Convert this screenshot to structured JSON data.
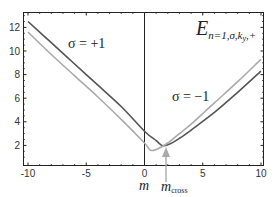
{
  "chart_data": {
    "type": "line",
    "xlabel": "m",
    "ylabel": "",
    "xlim": [
      -10,
      10
    ],
    "ylim": [
      0.35,
      13.2
    ],
    "xticks": [
      -10,
      -5,
      0,
      5,
      10
    ],
    "xtick_labels": [
      "-10",
      "-5",
      "0",
      "5",
      "10"
    ],
    "yticks": [
      2,
      4,
      6,
      8,
      10,
      12
    ],
    "ytick_labels": [
      "2",
      "4",
      "6",
      "8",
      "10",
      "12"
    ],
    "grid": false,
    "vertical_line_at_x": 0,
    "series": [
      {
        "name": "σ = +1",
        "color": "#555555",
        "x": [
          -10,
          -8,
          -6,
          -4,
          -2,
          0,
          1,
          1.5,
          2,
          3,
          4,
          6,
          8,
          10
        ],
        "y": [
          12.5,
          10.7,
          8.9,
          7.1,
          5.3,
          3.2,
          2.4,
          2.0,
          2.05,
          2.6,
          3.3,
          4.8,
          6.5,
          8.3
        ]
      },
      {
        "name": "σ = −1",
        "color": "#aaaaaa",
        "x": [
          -10,
          -8,
          -6,
          -4,
          -2,
          0,
          0.5,
          1,
          2,
          3,
          4,
          6,
          8,
          10
        ],
        "y": [
          11.6,
          9.7,
          7.9,
          6.1,
          4.2,
          2.2,
          1.6,
          1.65,
          2.2,
          3.0,
          3.8,
          5.6,
          7.4,
          9.3
        ]
      }
    ],
    "annotations": [
      {
        "text": "σ = +1",
        "x": -4.6,
        "y": 10.7
      },
      {
        "text": "σ = −1",
        "x": 3.2,
        "y": 6.3
      },
      {
        "text": "m_cross",
        "x": 1.8,
        "y": 0.35,
        "arrow": true
      }
    ],
    "legend": "none"
  },
  "labels": {
    "title_main": "E",
    "title_sub": "n=1,σ,k",
    "title_sub2": "y",
    "title_sub3": ",+",
    "sigma_plus": "σ = +1",
    "sigma_minus": "σ = −1",
    "xlabel": "m",
    "mcross_main": "m",
    "mcross_sub": "cross"
  }
}
